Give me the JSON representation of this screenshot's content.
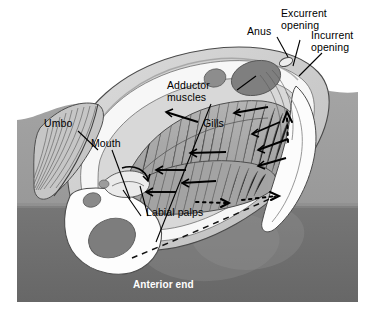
{
  "figure": {
    "background_color": "#ffffff"
  },
  "substrate": {
    "upper_color": "#9b9b9b",
    "lower_color": "#6e6e6e",
    "water_color": "#ffffff"
  },
  "palette": {
    "shell_outer": "#cfcfcf",
    "shell_inner": "#e9e9e9",
    "mantle_white": "#fdfdfd",
    "gill_fill": "#a8a8a8",
    "gill_line": "#5f5f5f",
    "muscle_dark": "#7a7a7a",
    "foot_shade": "#8f8f8f",
    "outline": "#3a3a3a",
    "arrow": "#000000"
  },
  "labels": {
    "anus": "Anus",
    "excurrent_opening": "Excurrent\nopening",
    "incurrent_opening": "Incurrent\nopening",
    "adductor_muscles": "Adductor\nmuscles",
    "gills": "Gills",
    "umbo": "Umbo",
    "mouth": "Mouth",
    "labial_palps": "Labial palps",
    "anterior_end": "Anterior end"
  },
  "flow": {
    "solid_arrow_meaning": "water current through gills",
    "dotted_arrow_meaning": "excurrent water leaving siphon",
    "dashed_line_meaning": "outline of foot / mantle margin"
  }
}
